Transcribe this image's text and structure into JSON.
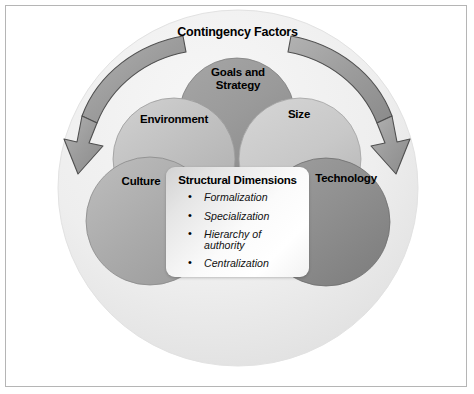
{
  "figure": {
    "outer_label": "Contingency Factors"
  },
  "circles": [
    {
      "id": "goals",
      "label": "Goals and\nStrategy",
      "color": "#9b9b9b"
    },
    {
      "id": "environment",
      "label": "Environment",
      "color": "#bdbdbd"
    },
    {
      "id": "size",
      "label": "Size",
      "color": "#c6c6c6"
    },
    {
      "id": "culture",
      "label": "Culture",
      "color": "#aeaeae"
    },
    {
      "id": "technology",
      "label": "Technology",
      "color": "#909090"
    }
  ],
  "arrows": {
    "left_arrow_name": "contingency-arrow-left",
    "right_arrow_name": "contingency-arrow-right",
    "color": "#9a9a9a",
    "stroke": "#4f4f4f"
  },
  "structural_box": {
    "title": "Structural Dimensions",
    "items": [
      "Formalization",
      "Specialization",
      "Hierarchy of authority",
      "Centralization"
    ]
  },
  "colors": {
    "background": "#ffffff",
    "frame_border": "#b5b5b5",
    "outer_oval_light": "#f0f0f0",
    "outer_oval_edge": "#dcdcdc",
    "text": "#000000"
  }
}
